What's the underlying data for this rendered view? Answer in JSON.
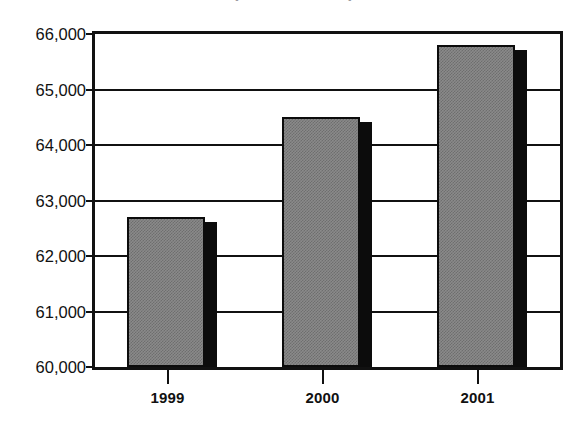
{
  "title": {
    "text": "(in thousands)",
    "clipped": true,
    "note": "title is cropped off the top edge of the screenshot; only the descenders of the parentheses are visible"
  },
  "chart_data": {
    "type": "bar",
    "title": "(in thousands)",
    "xlabel": "",
    "ylabel": "",
    "categories": [
      "1999",
      "2000",
      "2001"
    ],
    "values": [
      62700,
      64500,
      65800
    ],
    "value_labels": [
      "62,700",
      "64,500",
      "65,800"
    ],
    "ylim": [
      60000,
      66000
    ],
    "ytick_values": [
      60000,
      61000,
      62000,
      63000,
      64000,
      65000,
      66000
    ],
    "ytick_labels": [
      "60,000",
      "61,000",
      "62,000",
      "63,000",
      "64,000",
      "65,000",
      "66,000"
    ],
    "grid": true,
    "grid_axis": "y",
    "legend": null,
    "legend_position": "none",
    "series": [
      {
        "name": "Value",
        "values": [
          62700,
          64500,
          65800
        ]
      }
    ],
    "style": {
      "bar_fill": "#8a8a8a",
      "bar_fill_pattern": "50% checkerboard dither",
      "bar_outline": "#0c0c0c",
      "bar_side_shadow": "#0c0c0c",
      "axis_color": "#111111",
      "background": "#ffffff",
      "three_d_effect": true
    }
  },
  "axes": {
    "y": {
      "ticks": [
        {
          "label": "66,000",
          "value": 66000
        },
        {
          "label": "65,000",
          "value": 65000
        },
        {
          "label": "64,000",
          "value": 64000
        },
        {
          "label": "63,000",
          "value": 63000
        },
        {
          "label": "62,000",
          "value": 62000
        },
        {
          "label": "61,000",
          "value": 61000
        },
        {
          "label": "60,000",
          "value": 60000
        }
      ]
    },
    "x": {
      "ticks": [
        {
          "label": "1999"
        },
        {
          "label": "2000"
        },
        {
          "label": "2001"
        }
      ]
    }
  }
}
